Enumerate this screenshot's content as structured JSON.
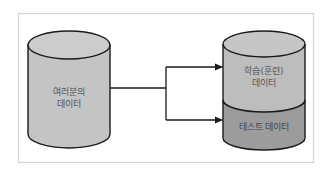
{
  "diagram": {
    "source": {
      "label_line1": "여러분의",
      "label_line2": "데이터",
      "fill": "#c4c4c4"
    },
    "target": {
      "train_label_line1": "학습(훈련)",
      "train_label_line2": "데이터",
      "test_label": "테스트 데이터",
      "train_fill": "#bdbdbd",
      "test_fill": "#9c9c9c"
    },
    "colors": {
      "frame": "#d6d6d6",
      "stroke": "#1a1a1a"
    }
  }
}
